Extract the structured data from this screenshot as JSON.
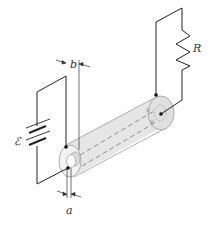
{
  "diagram": {
    "labels": {
      "emf": "ℰ",
      "resistor": "R",
      "outer_radius": "b",
      "inner_radius": "a"
    },
    "components": [
      {
        "id": "battery",
        "label": "ℰ"
      },
      {
        "id": "resistor",
        "label": "R"
      },
      {
        "id": "coaxial-cable",
        "inner_radius_label": "a",
        "outer_radius_label": "b"
      }
    ],
    "colors": {
      "line": "#222222",
      "cable_fill": "#e6e6e6",
      "cable_edge": "#9a9a9a"
    }
  }
}
